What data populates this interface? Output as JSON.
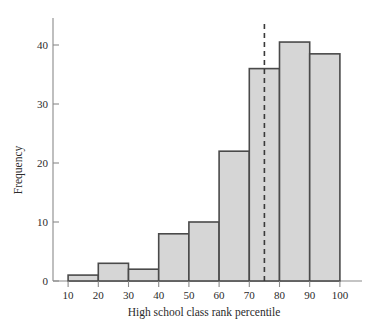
{
  "figure": {
    "background_color": "#ffffff",
    "bar_fill_color": "#d6d6d6",
    "bar_edge_color": "#4a4a4a",
    "axis_color": "#8a8a8a",
    "reference_line_color": "#3a3a3a"
  },
  "chart_data": {
    "type": "bar",
    "title": "",
    "subtitle": "",
    "xlabel": "High school class rank percentile",
    "ylabel": "Frequency",
    "categories": [
      "10-20",
      "20-30",
      "30-40",
      "40-50",
      "50-60",
      "60-70",
      "70-80",
      "80-90",
      "90-100"
    ],
    "bin_edges": [
      10,
      20,
      30,
      40,
      50,
      60,
      70,
      80,
      90,
      100
    ],
    "bin_width": 10,
    "values": [
      1,
      3,
      2,
      8,
      10,
      22,
      36,
      40.5,
      38.5
    ],
    "xlim": [
      5,
      108
    ],
    "ylim": [
      0,
      43
    ],
    "xticks": [
      10,
      20,
      30,
      40,
      50,
      60,
      70,
      80,
      90,
      100
    ],
    "xtick_labels": [
      "10",
      "20",
      "30",
      "40",
      "50",
      "60",
      "70",
      "80",
      "90",
      "100"
    ],
    "yticks": [
      0,
      10,
      20,
      30,
      40
    ],
    "ytick_labels": [
      "0",
      "10",
      "20",
      "30",
      "40"
    ],
    "grid": false,
    "legend": false,
    "legend_position": "none",
    "annotations": [
      {
        "name": "reference-line",
        "type": "vertical-dashed-line",
        "x": 75,
        "label": ""
      }
    ]
  }
}
